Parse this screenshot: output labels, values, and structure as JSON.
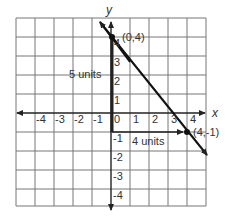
{
  "diagram": {
    "type": "coordinate-plane",
    "x_axis_label": "x",
    "y_axis_label": "y",
    "x_ticks": [
      "-4",
      "-3",
      "-2",
      "-1",
      "0",
      "1",
      "2",
      "3",
      "4"
    ],
    "y_ticks": [
      "4",
      "3",
      "2",
      "1",
      "-1",
      "-2",
      "-3",
      "-4"
    ],
    "grid": {
      "xmin": -5,
      "xmax": 5,
      "ymin": -5,
      "ymax": 5
    },
    "points": [
      {
        "label": "(0,4)",
        "x": 0,
        "y": 4
      },
      {
        "label": "(4,-1)",
        "x": 4,
        "y": -1
      }
    ],
    "annotations": {
      "vertical": "5 units",
      "horizontal": "4 units"
    },
    "line": {
      "through": [
        [
          0,
          4
        ],
        [
          4,
          -1
        ]
      ],
      "slope": "-5/4"
    },
    "colors": {
      "grid": "#777777",
      "axis": "#222222",
      "line": "#111111"
    }
  }
}
